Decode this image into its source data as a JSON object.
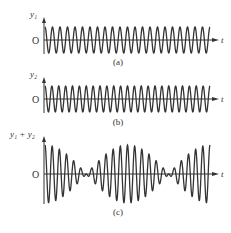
{
  "figure": {
    "panels": [
      {
        "id": "a",
        "ylabel": "y₁",
        "origin": "O",
        "xlabel": "t",
        "caption": "(a)",
        "axis_y": 40,
        "amp": 13,
        "cycles": 22
      },
      {
        "id": "b",
        "ylabel": "y₂",
        "origin": "O",
        "xlabel": "t",
        "caption": "(b)",
        "axis_y": 99,
        "amp": 13,
        "cycles": 24
      },
      {
        "id": "c",
        "ylabel": "y₁ + y₂",
        "origin": "O",
        "xlabel": "t",
        "caption": "(c)",
        "axis_y": 174,
        "amp": 29,
        "cycles": 23,
        "beats": 2
      }
    ],
    "stroke_color": "#333333"
  }
}
